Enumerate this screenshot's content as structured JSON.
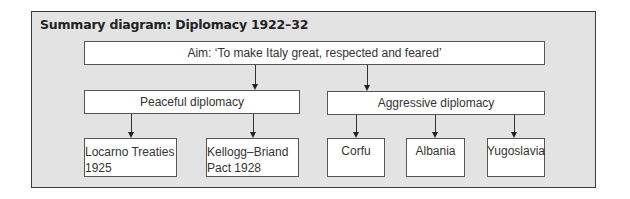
{
  "title": "Summary diagram: Diplomacy 1922–32",
  "aim": "Aim: ‘To make Italy great, respected and feared’",
  "branches": [
    {
      "label": "Peaceful diplomacy",
      "children": [
        "Locarno Treaties 1925",
        "Kellogg–Briand Pact 1928"
      ]
    },
    {
      "label": "Aggressive diplomacy",
      "children": [
        "Corfu",
        "Albania",
        "Yugoslavia"
      ]
    }
  ],
  "leaves": {
    "locarno": {
      "line1": "Locarno Treaties",
      "line2": "1925"
    },
    "kellogg": {
      "line1": "Kellogg–Briand",
      "line2": "Pact 1928"
    },
    "corfu": "Corfu",
    "albania": "Albania",
    "yugoslavia": "Yugoslavia"
  },
  "colors": {
    "panel": "#e3e3e3",
    "box": "#ffffff",
    "border": "#555555"
  }
}
